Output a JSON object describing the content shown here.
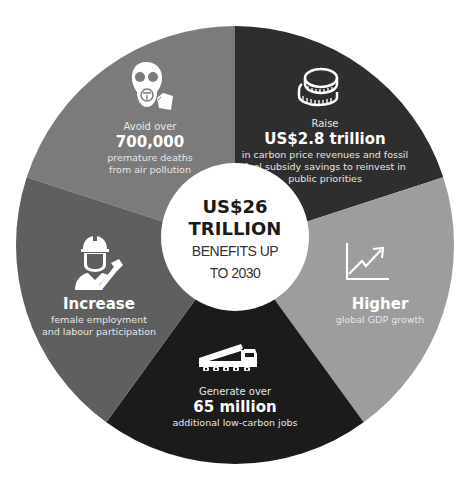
{
  "colors": {
    "slice_pollution": "#7b7b7b",
    "slice_revenue": "#2e2e2e",
    "slice_gdp": "#9d9d9d",
    "slice_jobs": "#1b1b1b",
    "slice_female": "#5f5f5f",
    "center_bg": "#ffffff",
    "center_text": "#1a1a1a"
  },
  "center": {
    "amount": "US$26",
    "unit": "TRILLION",
    "line3": "BENEFITS UP",
    "line4": "TO 2030"
  },
  "segments": [
    {
      "id": "pollution",
      "icon": "gas-mask-icon",
      "pre": "Avoid over",
      "big": "700,000",
      "desc": [
        "premature deaths",
        "from air pollution"
      ]
    },
    {
      "id": "revenue",
      "icon": "coins-icon",
      "pre": "Raise",
      "big": "US$2.8 trillion",
      "desc": [
        "in carbon price revenues and fossil",
        "fuel subsidy savings to reinvest in",
        "public priorities"
      ]
    },
    {
      "id": "gdp",
      "icon": "growth-chart-icon",
      "pre": "",
      "big": "Higher",
      "desc": [
        "global GDP growth"
      ]
    },
    {
      "id": "jobs",
      "icon": "crane-truck-icon",
      "pre": "Generate over",
      "big": "65 million",
      "desc": [
        "additional low-carbon jobs"
      ]
    },
    {
      "id": "female",
      "icon": "female-worker-icon",
      "pre": "",
      "big": "Increase",
      "desc": [
        "female employment",
        "and labour participation"
      ]
    }
  ]
}
